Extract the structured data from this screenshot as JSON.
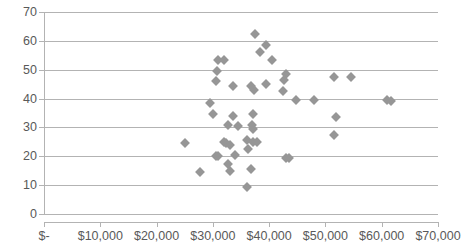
{
  "chart_data": {
    "type": "scatter",
    "title": "",
    "subtitle": "",
    "xlabel": "",
    "ylabel": "",
    "xlim": [
      0,
      70000
    ],
    "ylim": [
      0,
      70
    ],
    "grid": true,
    "legend": false,
    "legend_position": "none",
    "marker_shape": "diamond",
    "marker_color": "#969696",
    "gridline_color": "#b3b3b3",
    "axis_text_color": "#595959",
    "background_color": "#ffffff",
    "x_ticks": [
      0,
      10000,
      20000,
      30000,
      40000,
      50000,
      60000,
      70000
    ],
    "x_tick_labels": [
      "$-",
      "$10,000",
      "$20,000",
      "$30,000",
      "$40,000",
      "$50,000",
      "$60,000",
      "$70,000"
    ],
    "y_ticks": [
      0,
      10,
      20,
      30,
      40,
      50,
      60,
      70
    ],
    "y_tick_labels": [
      "0",
      "10",
      "20",
      "30",
      "40",
      "50",
      "60",
      "70"
    ],
    "series": [
      {
        "name": "Series 1",
        "points": [
          [
            37400,
            62.5
          ],
          [
            39500,
            58.5
          ],
          [
            38400,
            56.0
          ],
          [
            40500,
            53.5
          ],
          [
            30900,
            53.5
          ],
          [
            32000,
            53.5
          ],
          [
            30700,
            49.5
          ],
          [
            43000,
            48.5
          ],
          [
            42700,
            46.5
          ],
          [
            51500,
            47.5
          ],
          [
            54500,
            47.5
          ],
          [
            30500,
            46.0
          ],
          [
            33600,
            44.5
          ],
          [
            39500,
            45.0
          ],
          [
            37300,
            43.0
          ],
          [
            36800,
            44.5
          ],
          [
            42400,
            42.5
          ],
          [
            29500,
            38.5
          ],
          [
            44700,
            39.5
          ],
          [
            48000,
            39.5
          ],
          [
            61000,
            39.5
          ],
          [
            61600,
            39.0
          ],
          [
            30000,
            34.5
          ],
          [
            33500,
            34.0
          ],
          [
            37200,
            34.5
          ],
          [
            51800,
            33.5
          ],
          [
            32700,
            31.0
          ],
          [
            34400,
            30.5
          ],
          [
            36900,
            31.0
          ],
          [
            37100,
            29.5
          ],
          [
            51500,
            27.5
          ],
          [
            25000,
            24.5
          ],
          [
            32000,
            25.0
          ],
          [
            32400,
            24.5
          ],
          [
            33100,
            24.0
          ],
          [
            36000,
            25.5
          ],
          [
            37200,
            25.0
          ],
          [
            37900,
            25.0
          ],
          [
            36300,
            22.5
          ],
          [
            30500,
            20.0
          ],
          [
            30900,
            20.0
          ],
          [
            33900,
            20.5
          ],
          [
            43000,
            19.5
          ],
          [
            43500,
            19.5
          ],
          [
            32700,
            17.5
          ],
          [
            27800,
            14.5
          ],
          [
            33000,
            15.0
          ],
          [
            36800,
            15.5
          ],
          [
            36000,
            9.5
          ]
        ]
      }
    ]
  }
}
